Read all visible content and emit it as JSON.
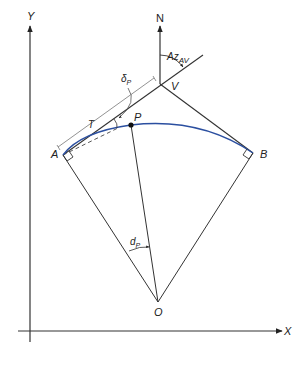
{
  "diagram": {
    "type": "horizontal circular curve geometry",
    "axes": {
      "x_label": "X",
      "y_label": "Y"
    },
    "north_label": "N",
    "points": {
      "A": "A",
      "B": "B",
      "V": "V",
      "P": "P",
      "O": "O"
    },
    "annotations": {
      "azimuth": {
        "base": "Az",
        "sub": "AV"
      },
      "deflection": {
        "base": "δ",
        "sub": "P"
      },
      "central_angle": {
        "base": "d",
        "sub": "P"
      },
      "tangent": "T"
    },
    "colors": {
      "curve": "#2b4fa0",
      "lines": "#333333",
      "dimension": "#777777"
    }
  }
}
